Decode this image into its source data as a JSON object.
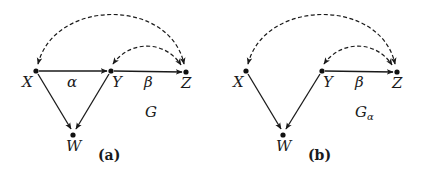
{
  "panels": [
    {
      "id": "a",
      "caption": "(a)",
      "graph_label": "G",
      "graph_label_subscript": "",
      "nodes": [
        {
          "name": "X",
          "x": 36,
          "y": 71
        },
        {
          "name": "Y",
          "x": 111,
          "y": 71
        },
        {
          "name": "Z",
          "x": 186,
          "y": 72
        },
        {
          "name": "W",
          "x": 73,
          "y": 135
        }
      ],
      "directed_edges": [
        {
          "from": "X",
          "to": "Y",
          "label": "α"
        },
        {
          "from": "Y",
          "to": "Z",
          "label": "β"
        },
        {
          "from": "X",
          "to": "W",
          "label": ""
        },
        {
          "from": "Y",
          "to": "W",
          "label": ""
        }
      ],
      "bidirected_edges": [
        {
          "a": "X",
          "b": "Z"
        },
        {
          "a": "Y",
          "b": "Z"
        }
      ]
    },
    {
      "id": "b",
      "caption": "(b)",
      "graph_label": "G",
      "graph_label_subscript": "α",
      "nodes": [
        {
          "name": "X",
          "x": 246,
          "y": 71
        },
        {
          "name": "Y",
          "x": 322,
          "y": 71
        },
        {
          "name": "Z",
          "x": 397,
          "y": 72
        },
        {
          "name": "W",
          "x": 283,
          "y": 135
        }
      ],
      "directed_edges": [
        {
          "from": "Y",
          "to": "Z",
          "label": "β"
        },
        {
          "from": "X",
          "to": "W",
          "label": ""
        },
        {
          "from": "Y",
          "to": "W",
          "label": ""
        }
      ],
      "bidirected_edges": [
        {
          "a": "X",
          "b": "Z"
        },
        {
          "a": "Y",
          "b": "Z"
        }
      ]
    }
  ],
  "labels": {
    "a": {
      "X": "X",
      "Y": "Y",
      "Z": "Z",
      "W": "W",
      "alpha": "α",
      "beta": "β",
      "G": "G",
      "caption": "(a)"
    },
    "b": {
      "X": "X",
      "Y": "Y",
      "Z": "Z",
      "W": "W",
      "beta": "β",
      "G": "G",
      "G_sub": "α",
      "caption": "(b)"
    }
  }
}
